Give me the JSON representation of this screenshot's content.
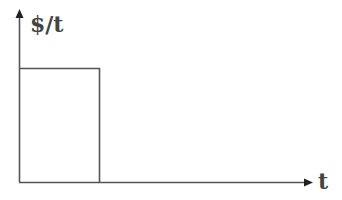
{
  "diagram": {
    "y_axis": {
      "label": "$/t",
      "arrow": "up"
    },
    "x_axis": {
      "label": "t",
      "arrow": "right"
    },
    "shape": {
      "type": "rectangle",
      "description": "constant rate pulse from t=0 to t=T"
    }
  },
  "colors": {
    "line": "#555555",
    "text": "#444444",
    "background": "#ffffff"
  }
}
